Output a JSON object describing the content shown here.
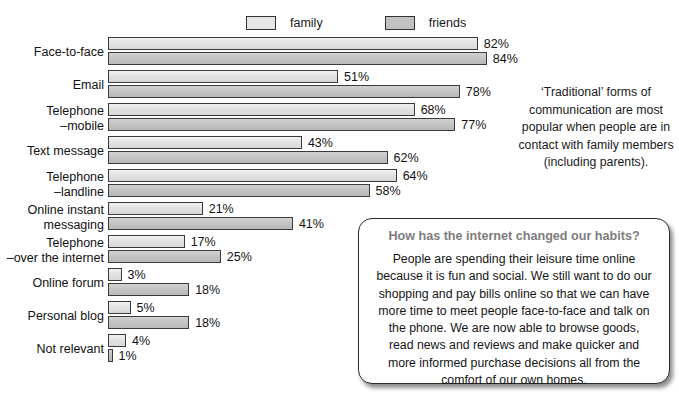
{
  "legend": {
    "items": [
      {
        "label": "family",
        "color": "#e6e6e6",
        "icon": "legend-swatch-icon"
      },
      {
        "label": "friends",
        "color": "#c2c2c2",
        "icon": "legend-swatch-icon"
      }
    ]
  },
  "side_note": {
    "text": "‘Traditional’ forms of communication are most popular when people are in contact with family members (including parents)."
  },
  "callout": {
    "heading": "How has the internet changed our habits?",
    "body": "People are spending their leisure time online because it is fun and social. We still want to do our shopping and pay bills online so that we can have more time to meet people face-to-face and talk on the phone. We are now able to browse goods, read news and reviews and make quicker and more informed purchase decisions all from the comfort of our own homes."
  },
  "chart_data": {
    "type": "bar",
    "orientation": "horizontal",
    "title": "",
    "xlabel": "",
    "ylabel": "",
    "xlim": [
      0,
      100
    ],
    "grid": false,
    "legend_position": "top",
    "value_suffix": "%",
    "px_per_unit": 4.51,
    "categories": [
      "Face-to-face",
      "Email",
      "Telephone\n–mobile",
      "Text message",
      "Telephone\n–landline",
      "Online instant\nmessaging",
      "Telephone\n–over the internet",
      "Online forum",
      "Personal blog",
      "Not relevant"
    ],
    "category_lines": [
      [
        "Face-to-face"
      ],
      [
        "Email"
      ],
      [
        "Telephone",
        "–mobile"
      ],
      [
        "Text message"
      ],
      [
        "Telephone",
        "–landline"
      ],
      [
        "Online instant",
        "messaging"
      ],
      [
        "Telephone",
        "–over the internet"
      ],
      [
        "Online forum"
      ],
      [
        "Personal blog"
      ],
      [
        "Not relevant"
      ]
    ],
    "series": [
      {
        "name": "family",
        "color": "#e6e6e6",
        "values": [
          82,
          51,
          68,
          43,
          64,
          21,
          17,
          3,
          5,
          4
        ],
        "labels": [
          "82%",
          "51%",
          "68%",
          "43%",
          "64%",
          "21%",
          "17%",
          "3%",
          "5%",
          "4%"
        ]
      },
      {
        "name": "friends",
        "color": "#c2c2c2",
        "values": [
          84,
          78,
          77,
          62,
          58,
          41,
          25,
          18,
          18,
          1
        ],
        "labels": [
          "84%",
          "78%",
          "77%",
          "62%",
          "58%",
          "41%",
          "25%",
          "18%",
          "18%",
          "1%"
        ]
      }
    ]
  }
}
